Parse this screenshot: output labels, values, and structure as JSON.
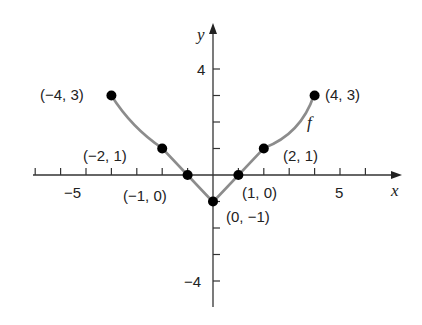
{
  "chart_data": {
    "type": "line",
    "title": "",
    "xlabel": "x",
    "ylabel": "y",
    "function_label": "f",
    "xlim": [
      -7,
      7
    ],
    "ylim": [
      -5,
      5
    ],
    "grid": false,
    "x_tick_labels": [
      {
        "value": -5,
        "label": "−5"
      },
      {
        "value": 5,
        "label": "5"
      }
    ],
    "y_tick_labels": [
      {
        "value": 4,
        "label": "4"
      },
      {
        "value": -4,
        "label": "−4"
      }
    ],
    "x_ticks": [
      -7,
      -6,
      -5,
      -4,
      -3,
      -2,
      -1,
      1,
      2,
      3,
      4,
      5,
      6
    ],
    "y_ticks": [
      -4,
      -3,
      -2,
      -1,
      1,
      2,
      3,
      4
    ],
    "points": [
      {
        "x": -4,
        "y": 3,
        "label": "(−4, 3)"
      },
      {
        "x": -2,
        "y": 1,
        "label": "(−2, 1)"
      },
      {
        "x": -1,
        "y": 0,
        "label": "(−1, 0)"
      },
      {
        "x": 0,
        "y": -1,
        "label": "(0, −1)"
      },
      {
        "x": 1,
        "y": 0,
        "label": "(1, 0)"
      },
      {
        "x": 2,
        "y": 1,
        "label": "(2, 1)"
      },
      {
        "x": 4,
        "y": 3,
        "label": "(4, 3)"
      }
    ],
    "colors": {
      "curve": "#8c8c8c",
      "points": "#000000",
      "axes": "#333333"
    }
  }
}
